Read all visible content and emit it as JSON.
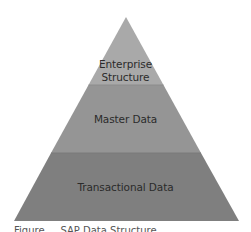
{
  "diagram": {
    "type": "pyramid",
    "layers": [
      {
        "label_lines": [
          "Enterprise",
          "Structure"
        ],
        "color": "#a9a9a9"
      },
      {
        "label_lines": [
          "Master Data"
        ],
        "color": "#959595"
      },
      {
        "label_lines": [
          "Transactional Data"
        ],
        "color": "#7f7f7f"
      }
    ],
    "caption": "Figure ... SAP Data Structure ..."
  }
}
